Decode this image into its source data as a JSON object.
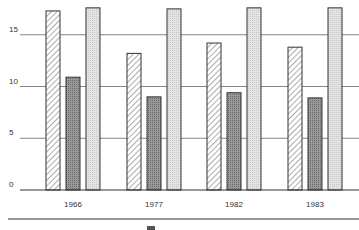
{
  "chart_data": {
    "type": "bar",
    "title": "",
    "xlabel": "",
    "ylabel": "",
    "categories": [
      "1966",
      "1977",
      "1982",
      "1983"
    ],
    "series": [
      {
        "name": "Series 1 (hatched)",
        "pattern": "diagonal-hatch",
        "values": [
          17.3,
          13.2,
          14.2,
          13.8
        ]
      },
      {
        "name": "Series 2 (dark)",
        "pattern": "dark-dotted",
        "values": [
          10.9,
          9.0,
          9.4,
          8.9
        ]
      },
      {
        "name": "Series 3 (light)",
        "pattern": "light-dotted",
        "values": [
          17.6,
          17.5,
          17.6,
          17.6
        ]
      }
    ],
    "yticks": [
      0,
      5,
      10,
      15
    ],
    "ytick_labels": [
      "0",
      "5",
      "10",
      "15"
    ],
    "ylim": [
      0,
      18
    ],
    "grid": true,
    "legend": {
      "position": "bottom",
      "entries_visible": []
    },
    "colors": {
      "hatched_fill": "#ffffff",
      "hatch_stroke": "#888888",
      "dark_fill": "#8a8a8a",
      "light_fill": "#dcdcdc",
      "bar_outline": "#333333",
      "gridline": "#666666"
    }
  }
}
